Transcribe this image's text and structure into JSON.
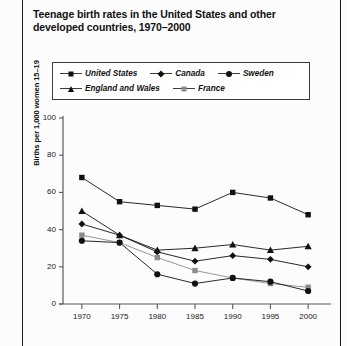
{
  "page": {
    "title": "Teenage birth rates in the United States and other developed countries, 1970–2000",
    "footnote": ""
  },
  "legend": {
    "rows": [
      [
        {
          "label": "United States",
          "marker": "square",
          "color": "#111111"
        },
        {
          "label": "Canada",
          "marker": "diamond",
          "color": "#111111"
        },
        {
          "label": "Sweden",
          "marker": "circle",
          "color": "#111111"
        }
      ],
      [
        {
          "label": "England and Wales",
          "marker": "triangle",
          "color": "#111111"
        },
        {
          "label": "France",
          "marker": "gsquare",
          "color": "#8c8c8c"
        }
      ]
    ]
  },
  "axes": {
    "y_label": "Births per 1,000 women 15–19",
    "y_ticks": [
      "0",
      "20",
      "40",
      "60",
      "80",
      "100"
    ],
    "x_ticks": [
      "1970",
      "1975",
      "1980",
      "1985",
      "1990",
      "1995",
      "2000"
    ]
  },
  "chart_data": {
    "type": "line",
    "title": "Teenage birth rates in the United States and other developed countries, 1970–2000",
    "xlabel": "",
    "ylabel": "Births per 1,000 women 15–19",
    "x": [
      1970,
      1975,
      1980,
      1985,
      1990,
      1995,
      2000
    ],
    "xlim": [
      1967.5,
      2002.5
    ],
    "ylim": [
      0,
      100
    ],
    "grid": false,
    "legend_position": "top",
    "series": [
      {
        "name": "United States",
        "marker": "square",
        "color": "#111111",
        "values": [
          68,
          55,
          53,
          51,
          60,
          57,
          48
        ]
      },
      {
        "name": "England and Wales",
        "marker": "triangle",
        "color": "#111111",
        "values": [
          50,
          37,
          29,
          30,
          32,
          29,
          31
        ]
      },
      {
        "name": "Canada",
        "marker": "diamond",
        "color": "#111111",
        "values": [
          43,
          37,
          28,
          23,
          26,
          24,
          20
        ]
      },
      {
        "name": "France",
        "marker": "gsquare",
        "color": "#8c8c8c",
        "values": [
          37,
          33,
          25,
          18,
          14,
          11,
          9
        ]
      },
      {
        "name": "Sweden",
        "marker": "circle",
        "color": "#111111",
        "values": [
          34,
          33,
          16,
          11,
          14,
          12,
          7
        ]
      }
    ]
  }
}
